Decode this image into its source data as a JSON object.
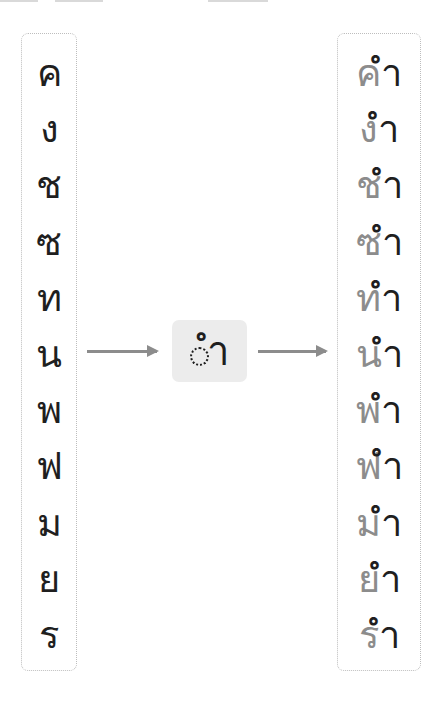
{
  "diagram": {
    "title": "",
    "consonants": [
      "ค",
      "ง",
      "ช",
      "ซ",
      "ท",
      "น",
      "พ",
      "ฟ",
      "ม",
      "ย",
      "ร"
    ],
    "vowel": {
      "symbol": "ำ",
      "display": "ำ",
      "placeholder_icon": "dotted-circle-icon"
    },
    "results": [
      {
        "consonant": "ค",
        "vowel": "ำ",
        "word": "คำ"
      },
      {
        "consonant": "ง",
        "vowel": "ำ",
        "word": "งำ"
      },
      {
        "consonant": "ช",
        "vowel": "ำ",
        "word": "ชำ"
      },
      {
        "consonant": "ซ",
        "vowel": "ำ",
        "word": "ซำ"
      },
      {
        "consonant": "ท",
        "vowel": "ำ",
        "word": "ทำ"
      },
      {
        "consonant": "น",
        "vowel": "ำ",
        "word": "นำ"
      },
      {
        "consonant": "พ",
        "vowel": "ำ",
        "word": "พำ"
      },
      {
        "consonant": "ฟ",
        "vowel": "ำ",
        "word": "ฟำ"
      },
      {
        "consonant": "ม",
        "vowel": "ำ",
        "word": "มำ"
      },
      {
        "consonant": "ย",
        "vowel": "ำ",
        "word": "ยำ"
      },
      {
        "consonant": "ร",
        "vowel": "ำ",
        "word": "รำ"
      }
    ],
    "colors": {
      "text": "#1f1f1f",
      "consonant_in_result": "#8c8c8c",
      "arrow": "#8c8c8c",
      "center_box_bg": "#ececec",
      "box_border": "#bdbdbd"
    }
  }
}
